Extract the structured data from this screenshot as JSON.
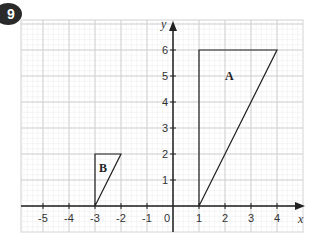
{
  "question_number": "9",
  "chart_data": {
    "type": "diagram",
    "title": "",
    "xlabel": "x",
    "ylabel": "y",
    "xlim": [
      -6,
      5
    ],
    "ylim": [
      -1,
      7
    ],
    "x_ticks": [
      "-5",
      "-4",
      "-3",
      "-2",
      "-1",
      "0",
      "1",
      "2",
      "3",
      "4"
    ],
    "y_ticks": [
      "1",
      "2",
      "3",
      "4",
      "5",
      "6"
    ],
    "grid": true,
    "shapes": [
      {
        "label": "A",
        "vertices": [
          [
            1,
            0
          ],
          [
            1,
            6
          ],
          [
            4,
            6
          ]
        ]
      },
      {
        "label": "B",
        "vertices": [
          [
            -3,
            0
          ],
          [
            -3,
            2
          ],
          [
            -2,
            2
          ]
        ]
      }
    ]
  }
}
